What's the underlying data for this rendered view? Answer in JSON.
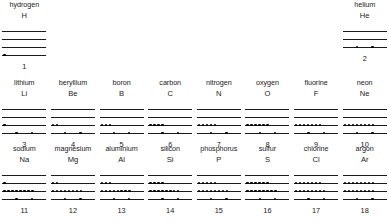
{
  "diagram": {
    "type": "energy-level-diagram",
    "line_color": "#1a1a1a",
    "electron_color": "#000000",
    "background": "#ffffff"
  },
  "rows": [
    {
      "period": 1,
      "shell_count": 4,
      "cells": [
        {
          "name": "hydrogen",
          "symbol": "H",
          "number": "1",
          "levels": [
            0,
            0,
            0,
            1
          ],
          "spread": [
            false,
            false,
            false,
            false
          ]
        },
        {
          "name": "",
          "symbol": "",
          "number": "",
          "levels": [],
          "spread": [],
          "empty": true
        },
        {
          "name": "",
          "symbol": "",
          "number": "",
          "levels": [],
          "spread": [],
          "empty": true
        },
        {
          "name": "",
          "symbol": "",
          "number": "",
          "levels": [],
          "spread": [],
          "empty": true
        },
        {
          "name": "",
          "symbol": "",
          "number": "",
          "levels": [],
          "spread": [],
          "empty": true
        },
        {
          "name": "",
          "symbol": "",
          "number": "",
          "levels": [],
          "spread": [],
          "empty": true
        },
        {
          "name": "",
          "symbol": "",
          "number": "",
          "levels": [],
          "spread": [],
          "empty": true
        },
        {
          "name": "helium",
          "symbol": "He",
          "number": "2",
          "levels": [
            0,
            0,
            2
          ],
          "spread": [
            false,
            false,
            true
          ]
        }
      ]
    },
    {
      "period": 2,
      "shell_count": 4,
      "cells": [
        {
          "name": "lithium",
          "symbol": "Li",
          "number": "3",
          "levels": [
            0,
            0,
            1,
            2
          ],
          "spread": [
            false,
            false,
            false,
            true
          ]
        },
        {
          "name": "beryllium",
          "symbol": "Be",
          "number": "4",
          "levels": [
            0,
            0,
            2,
            2
          ],
          "spread": [
            false,
            false,
            false,
            true
          ]
        },
        {
          "name": "boron",
          "symbol": "B",
          "number": "5",
          "levels": [
            0,
            0,
            3,
            2
          ],
          "spread": [
            false,
            false,
            false,
            true
          ]
        },
        {
          "name": "carbon",
          "symbol": "C",
          "number": "6",
          "levels": [
            0,
            0,
            4,
            2
          ],
          "spread": [
            false,
            false,
            false,
            true
          ]
        },
        {
          "name": "nitrogen",
          "symbol": "N",
          "number": "7",
          "levels": [
            0,
            0,
            5,
            2
          ],
          "spread": [
            false,
            false,
            false,
            true
          ]
        },
        {
          "name": "oxygen",
          "symbol": "O",
          "number": "8",
          "levels": [
            0,
            0,
            6,
            2
          ],
          "spread": [
            false,
            false,
            false,
            true
          ]
        },
        {
          "name": "fluorine",
          "symbol": "F",
          "number": "9",
          "levels": [
            0,
            0,
            7,
            2
          ],
          "spread": [
            false,
            false,
            false,
            true
          ]
        },
        {
          "name": "neon",
          "symbol": "Ne",
          "number": "10",
          "levels": [
            0,
            0,
            8,
            2
          ],
          "spread": [
            false,
            false,
            false,
            true
          ]
        }
      ]
    },
    {
      "period": 3,
      "shell_count": 4,
      "cells": [
        {
          "name": "sodium",
          "symbol": "Na",
          "number": "11",
          "levels": [
            0,
            1,
            8,
            2
          ],
          "spread": [
            false,
            false,
            false,
            true
          ]
        },
        {
          "name": "magnesium",
          "symbol": "Mg",
          "number": "12",
          "levels": [
            0,
            2,
            8,
            2
          ],
          "spread": [
            false,
            false,
            false,
            true
          ]
        },
        {
          "name": "aluminium",
          "symbol": "Al",
          "number": "13",
          "levels": [
            0,
            3,
            8,
            2
          ],
          "spread": [
            false,
            false,
            false,
            true
          ]
        },
        {
          "name": "silicon",
          "symbol": "Si",
          "number": "14",
          "levels": [
            0,
            4,
            8,
            2
          ],
          "spread": [
            false,
            false,
            false,
            true
          ]
        },
        {
          "name": "phosphorus",
          "symbol": "P",
          "number": "15",
          "levels": [
            0,
            5,
            8,
            2
          ],
          "spread": [
            false,
            false,
            false,
            true
          ]
        },
        {
          "name": "sulfur",
          "symbol": "S",
          "number": "16",
          "levels": [
            0,
            6,
            8,
            2
          ],
          "spread": [
            false,
            false,
            false,
            true
          ]
        },
        {
          "name": "chlorine",
          "symbol": "Cl",
          "number": "17",
          "levels": [
            0,
            7,
            8,
            2
          ],
          "spread": [
            false,
            false,
            false,
            true
          ]
        },
        {
          "name": "argon",
          "symbol": "Ar",
          "number": "18",
          "levels": [
            0,
            8,
            8,
            2
          ],
          "spread": [
            false,
            false,
            false,
            true
          ]
        }
      ]
    }
  ]
}
